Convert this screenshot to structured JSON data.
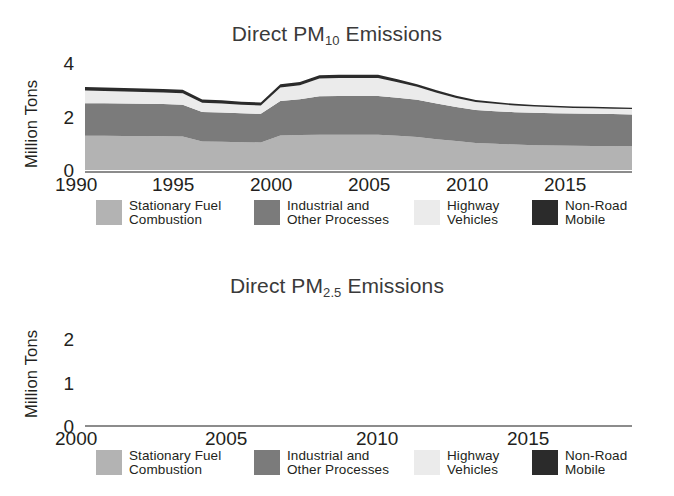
{
  "charts": [
    {
      "id": "pm10",
      "title_prefix": "Direct PM",
      "title_sub": "10",
      "title_suffix": " Emissions",
      "title_full": "Direct PM10 Emissions",
      "ylabel": "Million Tons",
      "yticks": [
        "4",
        "2",
        "0"
      ],
      "xticks": [
        "1990",
        "1995",
        "2000",
        "2005",
        "2010",
        "2015"
      ],
      "legend": [
        {
          "label": "Stationary Fuel\nCombustion",
          "color": "#b3b3b3"
        },
        {
          "label": "Industrial and\nOther Processes",
          "color": "#7b7b7b"
        },
        {
          "label": "Highway\nVehicles",
          "color": "#ebebeb"
        },
        {
          "label": "Non-Road\nMobile",
          "color": "#2b2b2b"
        }
      ]
    },
    {
      "id": "pm25",
      "title_prefix": "Direct PM",
      "title_sub": "2.5",
      "title_suffix": " Emissions",
      "title_full": "Direct PM2.5 Emissions",
      "ylabel": "Million Tons",
      "yticks": [
        "2",
        "1",
        "0"
      ],
      "xticks": [
        "2000",
        "2005",
        "2010",
        "2015"
      ],
      "legend": [
        {
          "label": "Stationary Fuel\nCombustion",
          "color": "#b3b3b3"
        },
        {
          "label": "Industrial and\nOther Processes",
          "color": "#7b7b7b"
        },
        {
          "label": "Highway\nVehicles",
          "color": "#ebebeb"
        },
        {
          "label": "Non-Road\nMobile",
          "color": "#2b2b2b"
        }
      ]
    }
  ],
  "chart_data": [
    {
      "type": "area",
      "stacked": true,
      "title": "Direct PM10 Emissions",
      "xlabel": "",
      "ylabel": "Million Tons",
      "xlim": [
        1990,
        2018
      ],
      "ylim": [
        0,
        4
      ],
      "yticks": [
        0,
        2,
        4
      ],
      "xticks": [
        1990,
        1995,
        2000,
        2005,
        2010,
        2015
      ],
      "grid": false,
      "legend_position": "bottom",
      "x": [
        1990,
        1991,
        1992,
        1993,
        1994,
        1995,
        1996,
        1997,
        1998,
        1999,
        2000,
        2001,
        2002,
        2003,
        2004,
        2005,
        2006,
        2007,
        2008,
        2009,
        2010,
        2011,
        2012,
        2013,
        2014,
        2015,
        2016,
        2017,
        2018
      ],
      "series": [
        {
          "name": "Stationary Fuel Combustion",
          "color": "#b3b3b3",
          "values": [
            1.27,
            1.27,
            1.26,
            1.26,
            1.25,
            1.24,
            1.06,
            1.05,
            1.03,
            1.02,
            1.28,
            1.3,
            1.31,
            1.31,
            1.31,
            1.31,
            1.27,
            1.22,
            1.14,
            1.07,
            1.0,
            0.97,
            0.94,
            0.92,
            0.91,
            0.9,
            0.89,
            0.89,
            0.88
          ]
        },
        {
          "name": "Industrial and Other Processes",
          "color": "#7b7b7b",
          "values": [
            1.2,
            1.2,
            1.2,
            1.19,
            1.19,
            1.18,
            1.09,
            1.08,
            1.07,
            1.06,
            1.28,
            1.32,
            1.42,
            1.43,
            1.43,
            1.43,
            1.41,
            1.38,
            1.32,
            1.26,
            1.22,
            1.21,
            1.2,
            1.2,
            1.19,
            1.19,
            1.19,
            1.18,
            1.18
          ]
        },
        {
          "name": "Highway Vehicles",
          "color": "#ebebeb",
          "values": [
            0.47,
            0.46,
            0.45,
            0.44,
            0.43,
            0.42,
            0.34,
            0.33,
            0.32,
            0.31,
            0.5,
            0.52,
            0.66,
            0.67,
            0.67,
            0.67,
            0.57,
            0.48,
            0.4,
            0.34,
            0.3,
            0.27,
            0.25,
            0.23,
            0.22,
            0.21,
            0.21,
            0.2,
            0.2
          ]
        },
        {
          "name": "Non-Road Mobile",
          "color": "#2b2b2b",
          "values": [
            0.13,
            0.13,
            0.13,
            0.13,
            0.13,
            0.13,
            0.12,
            0.12,
            0.11,
            0.11,
            0.12,
            0.12,
            0.12,
            0.12,
            0.12,
            0.12,
            0.11,
            0.1,
            0.09,
            0.08,
            0.07,
            0.07,
            0.06,
            0.06,
            0.06,
            0.05,
            0.05,
            0.05,
            0.05
          ]
        }
      ]
    },
    {
      "type": "area",
      "stacked": true,
      "title": "Direct PM2.5 Emissions",
      "xlabel": "",
      "ylabel": "Million Tons",
      "xlim": [
        2000,
        2018
      ],
      "ylim": [
        0,
        2.5
      ],
      "yticks": [
        0,
        1,
        2
      ],
      "xticks": [
        2000,
        2005,
        2010,
        2015
      ],
      "grid": false,
      "legend_position": "bottom",
      "x": [
        2000,
        2001,
        2002,
        2003,
        2004,
        2005,
        2006,
        2007,
        2008,
        2009,
        2010,
        2011,
        2012,
        2013,
        2014,
        2015,
        2016,
        2017,
        2018
      ],
      "series": [
        {
          "name": "Stationary Fuel Combustion",
          "color": "#b3b3b3",
          "values": [
            1.22,
            1.22,
            1.11,
            1.1,
            1.1,
            1.09,
            1.03,
            0.95,
            0.86,
            0.81,
            0.79,
            0.78,
            0.77,
            0.77,
            0.76,
            0.76,
            0.76,
            0.75,
            0.75
          ]
        },
        {
          "name": "Industrial and Other Processes",
          "color": "#7b7b7b",
          "values": [
            0.82,
            0.83,
            0.78,
            0.78,
            0.78,
            0.78,
            0.72,
            0.66,
            0.58,
            0.55,
            0.54,
            0.53,
            0.53,
            0.52,
            0.52,
            0.52,
            0.52,
            0.52,
            0.51
          ]
        },
        {
          "name": "Highway Vehicles",
          "color": "#ebebeb",
          "values": [
            0.2,
            0.21,
            0.26,
            0.26,
            0.26,
            0.26,
            0.22,
            0.19,
            0.16,
            0.14,
            0.13,
            0.12,
            0.11,
            0.1,
            0.1,
            0.09,
            0.09,
            0.09,
            0.09
          ]
        },
        {
          "name": "Non-Road Mobile",
          "color": "#2b2b2b",
          "values": [
            0.12,
            0.12,
            0.12,
            0.12,
            0.12,
            0.12,
            0.11,
            0.1,
            0.09,
            0.08,
            0.08,
            0.07,
            0.07,
            0.06,
            0.06,
            0.06,
            0.06,
            0.05,
            0.05
          ]
        }
      ]
    }
  ]
}
